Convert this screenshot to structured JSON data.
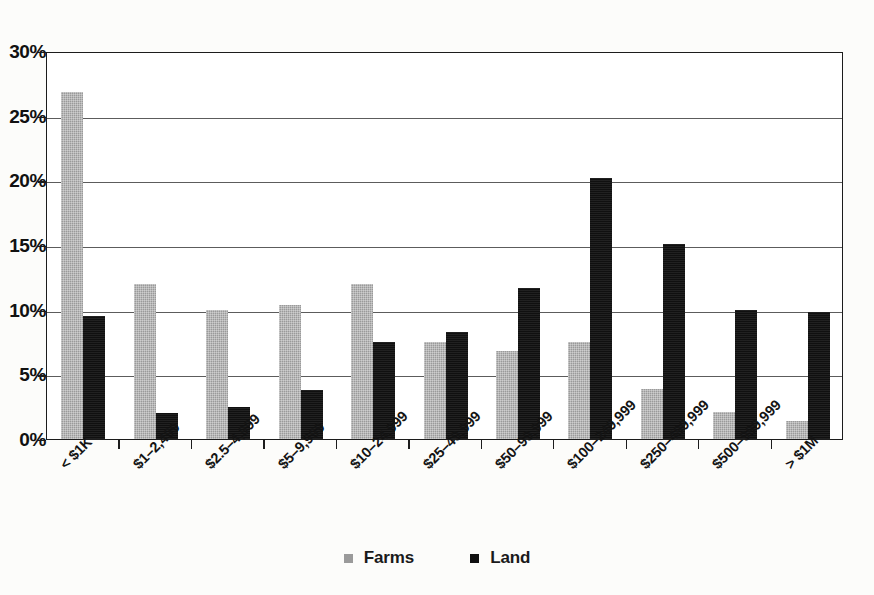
{
  "chart_data": {
    "type": "bar",
    "title": "",
    "subtitle": "",
    "xlabel": "",
    "ylabel": "",
    "ylim": [
      0,
      30
    ],
    "ytick_values": [
      30,
      25,
      20,
      15,
      10,
      5,
      0
    ],
    "ytick_labels": [
      "30%",
      "25%",
      "20%",
      "15%",
      "10%",
      "5%",
      "0%"
    ],
    "grid": true,
    "legend_position": "bottom-center",
    "categories": [
      "< $1K",
      "$1–2,499",
      "$2.5–4,999",
      "$5–9,999",
      "$10–24,999",
      "$25–49,999",
      "$50–99,999",
      "$100–249,999",
      "$250–499,999",
      "$500–999,999",
      "> $1M"
    ],
    "series": [
      {
        "name": "Farms",
        "color": "#9a9a9a",
        "values": [
          26.8,
          12.0,
          10.0,
          10.4,
          12.0,
          7.5,
          6.8,
          7.5,
          3.9,
          2.1,
          1.4
        ]
      },
      {
        "name": "Land",
        "color": "#101010",
        "values": [
          9.5,
          2.0,
          2.5,
          3.8,
          7.5,
          8.3,
          11.7,
          20.2,
          15.1,
          10.0,
          9.8
        ]
      }
    ]
  },
  "legend": {
    "items": [
      {
        "label": "Farms",
        "swatch": "farms"
      },
      {
        "label": "Land",
        "swatch": "land"
      }
    ]
  }
}
